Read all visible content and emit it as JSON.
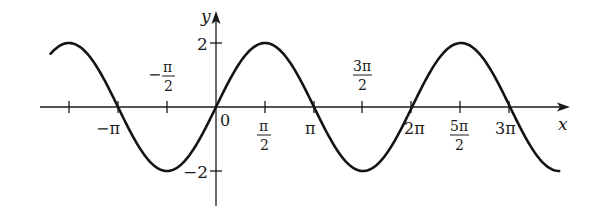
{
  "chart_data": {
    "type": "line",
    "title": "",
    "function": "y = 2 sin x",
    "xlabel": "x",
    "ylabel": "y",
    "x_range": [
      -5.3,
      11.0
    ],
    "ylim": [
      -3,
      3
    ],
    "grid": false,
    "legend": null,
    "series": [
      {
        "name": "y = 2 sin x",
        "x": [
          -4.712,
          -3.142,
          -1.571,
          0,
          1.571,
          3.142,
          4.712,
          6.283,
          7.854,
          9.425
        ],
        "values": [
          2,
          0,
          -2,
          0,
          2,
          0,
          -2,
          0,
          2,
          0
        ]
      }
    ],
    "x_ticks": [
      {
        "value": -4.712,
        "label": ""
      },
      {
        "value": -3.142,
        "label": "−π"
      },
      {
        "value": -1.571,
        "label_num": "−π",
        "label_den": "2"
      },
      {
        "value": 0,
        "label": "0"
      },
      {
        "value": 1.571,
        "label_num": "π",
        "label_den": "2"
      },
      {
        "value": 3.142,
        "label": "π"
      },
      {
        "value": 4.712,
        "label_num": "3π",
        "label_den": "2"
      },
      {
        "value": 6.283,
        "label": "2π"
      },
      {
        "value": 7.854,
        "label_num": "5π",
        "label_den": "2"
      },
      {
        "value": 9.425,
        "label": "3π"
      }
    ],
    "y_ticks": [
      {
        "value": 2,
        "label": "2"
      },
      {
        "value": -2,
        "label": "−2"
      }
    ]
  },
  "labels": {
    "x_axis": "x",
    "y_axis": "y",
    "origin": "0",
    "neg_pi": "−π",
    "neg_half_pi_num": "−",
    "neg_half_pi_pi": "π",
    "neg_half_pi_den": "2",
    "half_pi_num": "π",
    "half_pi_den": "2",
    "pi": "π",
    "three_half_pi_num": "3π",
    "three_half_pi_den": "2",
    "two_pi": "2π",
    "five_half_pi_num": "5π",
    "five_half_pi_den": "2",
    "three_pi": "3π",
    "y_two": "2",
    "y_neg_two": "−2"
  }
}
